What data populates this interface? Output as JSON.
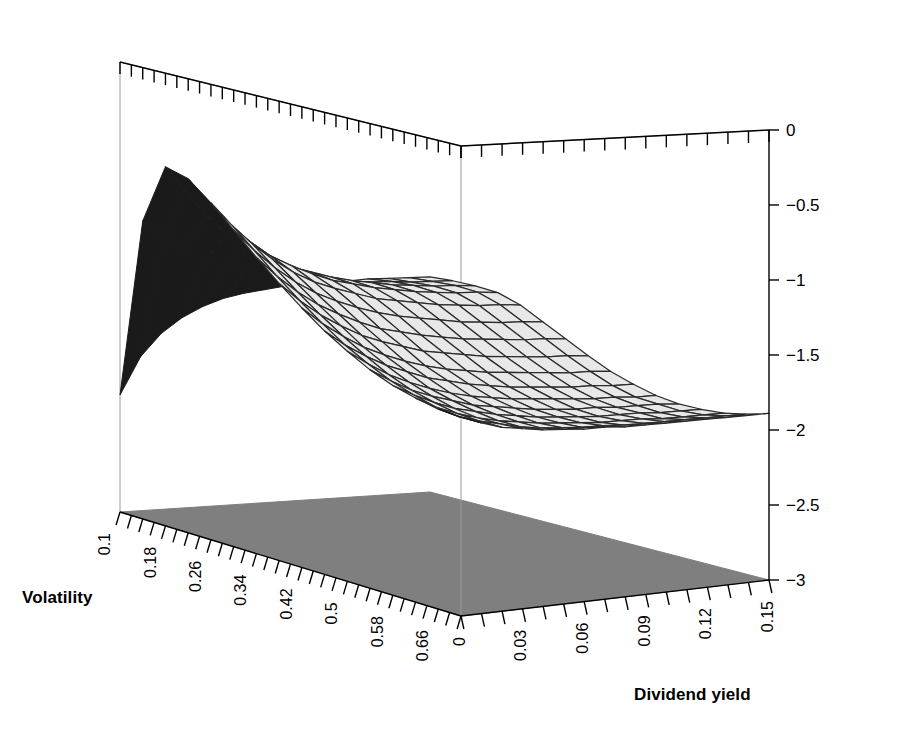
{
  "chart_data": {
    "type": "surface",
    "title": "",
    "xlabel": "Volatility",
    "ylabel": "Dividend yield",
    "zlabel": "",
    "grid": false,
    "legend": "none",
    "projection": "3d-wireframe-persp",
    "x": {
      "name": "Volatility",
      "min": 0.1,
      "max": 0.7,
      "tick_step": 0.02,
      "label_step": 0.08,
      "tick_labels": [
        "0.1",
        "0.18",
        "0.26",
        "0.34",
        "0.42",
        "0.5",
        "0.58",
        "0.66"
      ],
      "tick_values": [
        0.1,
        0.18,
        0.26,
        0.34,
        0.42,
        0.5,
        0.58,
        0.66
      ]
    },
    "y": {
      "name": "Dividend yield",
      "min": 0.0,
      "max": 0.15,
      "tick_step": 0.01,
      "label_step": 0.03,
      "tick_labels": [
        "0",
        "0.03",
        "0.06",
        "0.09",
        "0.12",
        "0.15"
      ],
      "tick_values": [
        0.0,
        0.03,
        0.06,
        0.09,
        0.12,
        0.15
      ]
    },
    "z": {
      "min": -3,
      "max": 0,
      "tick_step": 0.5,
      "tick_labels": [
        "0",
        "−0.5",
        "−1",
        "−1.5",
        "−2",
        "−2.5",
        "−3"
      ],
      "tick_values": [
        0,
        -0.5,
        -1,
        -1.5,
        -2,
        -2.5,
        -3
      ]
    },
    "surface": {
      "nx": 16,
      "ny": 16,
      "x_range": [
        0.1,
        0.7
      ],
      "y_range": [
        0.0,
        0.15
      ],
      "peak_value": -0.62,
      "peak_at": {
        "volatility": 0.18,
        "dividend_yield": 0.0
      },
      "min_corner_value": -2.22,
      "min_corner_at": {
        "volatility": 0.1,
        "dividend_yield": 0.0
      },
      "far_right_value": -1.5,
      "far_right_at": {
        "volatility": 0.1,
        "dividend_yield": 0.15
      },
      "front_right_value": -1.92,
      "front_right_at": {
        "volatility": 0.7,
        "dividend_yield": 0.06
      },
      "values_grid": [
        [
          -2.22,
          -1.97,
          -1.82,
          -1.72,
          -1.65,
          -1.6,
          -1.57,
          -1.55,
          -1.53,
          -1.52,
          -1.51,
          -1.51,
          -1.5,
          -1.5,
          -1.5,
          -1.5
        ],
        [
          -1.02,
          -1.12,
          -1.22,
          -1.29,
          -1.34,
          -1.38,
          -1.41,
          -1.43,
          -1.45,
          -1.46,
          -1.47,
          -1.48,
          -1.48,
          -1.49,
          -1.49,
          -1.49
        ],
        [
          -0.62,
          -0.79,
          -0.95,
          -1.08,
          -1.17,
          -1.25,
          -1.31,
          -1.35,
          -1.39,
          -1.42,
          -1.44,
          -1.46,
          -1.47,
          -1.48,
          -1.48,
          -1.49
        ],
        [
          -0.66,
          -0.82,
          -0.97,
          -1.09,
          -1.19,
          -1.26,
          -1.32,
          -1.37,
          -1.4,
          -1.43,
          -1.45,
          -1.47,
          -1.48,
          -1.49,
          -1.49,
          -1.5
        ],
        [
          -0.78,
          -0.93,
          -1.06,
          -1.17,
          -1.26,
          -1.33,
          -1.38,
          -1.42,
          -1.46,
          -1.48,
          -1.5,
          -1.52,
          -1.53,
          -1.54,
          -1.54,
          -1.55
        ],
        [
          -0.92,
          -1.06,
          -1.18,
          -1.28,
          -1.36,
          -1.42,
          -1.47,
          -1.51,
          -1.54,
          -1.56,
          -1.58,
          -1.6,
          -1.61,
          -1.62,
          -1.62,
          -1.63
        ],
        [
          -1.06,
          -1.19,
          -1.3,
          -1.39,
          -1.46,
          -1.52,
          -1.57,
          -1.6,
          -1.63,
          -1.65,
          -1.67,
          -1.68,
          -1.69,
          -1.7,
          -1.7,
          -1.71
        ],
        [
          -1.19,
          -1.31,
          -1.41,
          -1.49,
          -1.56,
          -1.61,
          -1.65,
          -1.69,
          -1.71,
          -1.73,
          -1.75,
          -1.76,
          -1.77,
          -1.78,
          -1.78,
          -1.79
        ],
        [
          -1.31,
          -1.42,
          -1.51,
          -1.59,
          -1.65,
          -1.7,
          -1.74,
          -1.77,
          -1.79,
          -1.81,
          -1.82,
          -1.83,
          -1.84,
          -1.85,
          -1.85,
          -1.86
        ],
        [
          -1.42,
          -1.52,
          -1.6,
          -1.67,
          -1.72,
          -1.77,
          -1.8,
          -1.83,
          -1.85,
          -1.87,
          -1.88,
          -1.89,
          -1.9,
          -1.9,
          -1.91,
          -1.91
        ],
        [
          -1.51,
          -1.6,
          -1.68,
          -1.74,
          -1.79,
          -1.83,
          -1.86,
          -1.88,
          -1.9,
          -1.91,
          -1.92,
          -1.93,
          -1.94,
          -1.94,
          -1.95,
          -1.95
        ],
        [
          -1.59,
          -1.67,
          -1.74,
          -1.79,
          -1.83,
          -1.87,
          -1.89,
          -1.91,
          -1.93,
          -1.94,
          -1.95,
          -1.95,
          -1.96,
          -1.96,
          -1.96,
          -1.97
        ],
        [
          -1.65,
          -1.72,
          -1.78,
          -1.83,
          -1.86,
          -1.89,
          -1.91,
          -1.93,
          -1.94,
          -1.95,
          -1.96,
          -1.96,
          -1.96,
          -1.97,
          -1.97,
          -1.97
        ],
        [
          -1.69,
          -1.76,
          -1.81,
          -1.85,
          -1.88,
          -1.9,
          -1.92,
          -1.93,
          -1.94,
          -1.95,
          -1.95,
          -1.95,
          -1.96,
          -1.96,
          -1.96,
          -1.96
        ],
        [
          -1.72,
          -1.78,
          -1.82,
          -1.85,
          -1.88,
          -1.9,
          -1.91,
          -1.92,
          -1.92,
          -1.93,
          -1.93,
          -1.93,
          -1.93,
          -1.93,
          -1.93,
          -1.93
        ],
        [
          -1.73,
          -1.78,
          -1.82,
          -1.84,
          -1.86,
          -1.87,
          -1.88,
          -1.88,
          -1.89,
          -1.89,
          -1.89,
          -1.89,
          -1.89,
          -1.89,
          -1.89,
          -1.89
        ]
      ]
    },
    "colors": {
      "surface_fill": "#e8e8e8",
      "surface_shadow_fill": "#1a1a1a",
      "mesh_line": "#2b2b2b",
      "floor_fill": "#7f7f7f",
      "axis_line": "#000000",
      "back_edge_line": "#9a9a9a",
      "text": "#000000"
    }
  },
  "axes": {
    "volatility_title": "Volatility",
    "dividend_title": "Dividend yield"
  }
}
